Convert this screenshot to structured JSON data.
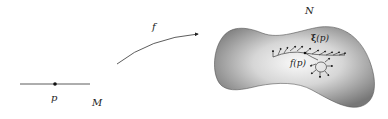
{
  "diagram": {
    "domain_manifold": {
      "label": "M",
      "point_label": "p"
    },
    "map": {
      "label": "f"
    },
    "target_manifold": {
      "label": "N",
      "image_point_label": "f(p)",
      "vector_field_label_bold": "ξ",
      "vector_field_label_rest": "(p)"
    },
    "colors": {
      "stroke": "#222222",
      "surface_dark": "#7a7a7a",
      "surface_light": "#f2f2f2"
    }
  }
}
